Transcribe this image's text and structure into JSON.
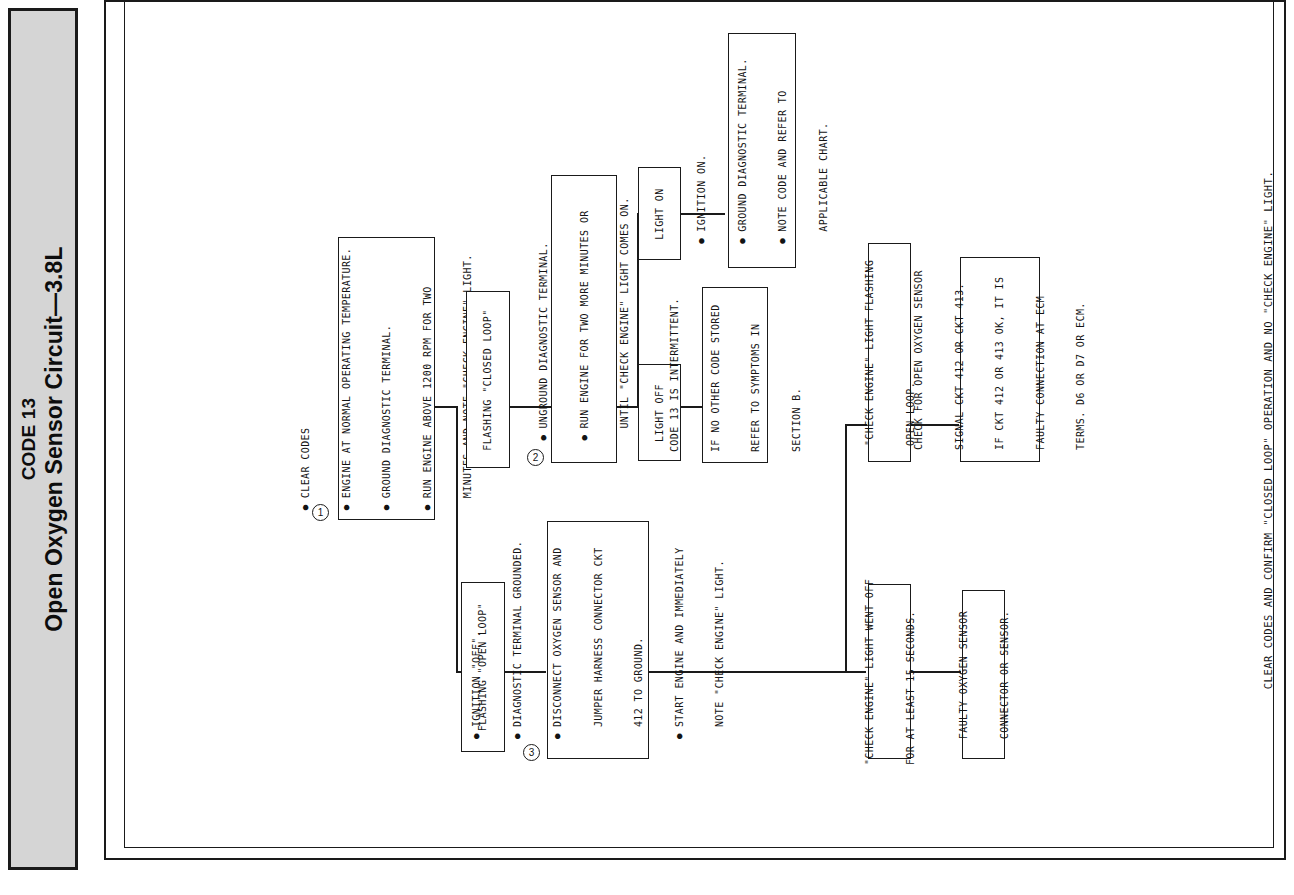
{
  "document": {
    "orientation": "rotated-90-ccw",
    "type": "diagnostic-flowchart"
  },
  "header": {
    "code_label": "CODE 13",
    "title": "Open Oxygen Sensor Circuit—3.8L",
    "band_color": "#d5d5d5",
    "border_color": "#1a1a1a"
  },
  "footer": {
    "note": "CLEAR CODES AND CONFIRM \"CLOSED LOOP\" OPERATION AND NO \"CHECK ENGINE\" LIGHT."
  },
  "steps": {
    "one": "1",
    "two": "2",
    "three": "3"
  },
  "boxes": {
    "step1": {
      "name": "clear-codes-step",
      "step": "1",
      "lines": [
        {
          "bullet": true,
          "text": "CLEAR CODES"
        },
        {
          "bullet": true,
          "text": "ENGINE AT NORMAL OPERATING TEMPERATURE."
        },
        {
          "bullet": true,
          "text": "GROUND DIAGNOSTIC TERMINAL."
        },
        {
          "bullet": true,
          "text": "RUN ENGINE ABOVE 1200 RPM FOR TWO"
        },
        {
          "bullet": false,
          "text": "MINUTES AND NOTE \"CHECK ENGINE\" LIGHT."
        }
      ]
    },
    "flashing_closed_loop": {
      "name": "flashing-closed-loop",
      "lines": [
        {
          "bullet": false,
          "text": "FLASHING \"CLOSED LOOP\""
        }
      ]
    },
    "step2": {
      "name": "unground-terminal-step",
      "step": "2",
      "lines": [
        {
          "bullet": true,
          "text": "UNGROUND DIAGNOSTIC TERMINAL."
        },
        {
          "bullet": true,
          "text": "RUN ENGINE FOR TWO MORE MINUTES OR"
        },
        {
          "bullet": false,
          "text": "UNTIL \"CHECK ENGINE\" LIGHT COMES ON."
        }
      ]
    },
    "light_on": {
      "name": "light-on-branch",
      "lines": [
        {
          "bullet": false,
          "text": "LIGHT ON"
        }
      ]
    },
    "light_off": {
      "name": "light-off-branch",
      "lines": [
        {
          "bullet": false,
          "text": "LIGHT OFF"
        }
      ]
    },
    "ignition_on": {
      "name": "ignition-on-step",
      "lines": [
        {
          "bullet": true,
          "text": "IGNITION ON."
        },
        {
          "bullet": true,
          "text": "GROUND DIAGNOSTIC TERMINAL."
        },
        {
          "bullet": true,
          "text": "NOTE CODE AND REFER TO"
        },
        {
          "bullet": false,
          "text": "APPLICABLE CHART."
        }
      ]
    },
    "intermittent": {
      "name": "code-13-intermittent",
      "lines": [
        {
          "bullet": false,
          "text": "CODE 13 IS INTERMITTENT."
        },
        {
          "bullet": false,
          "text": "IF NO OTHER CODE STORED"
        },
        {
          "bullet": false,
          "text": "REFER TO SYMPTOMS IN"
        },
        {
          "bullet": false,
          "text": "SECTION B."
        }
      ]
    },
    "flashing_open_loop_result": {
      "name": "check-engine-flashing-open-loop",
      "lines": [
        {
          "bullet": false,
          "text": "\"CHECK ENGINE\" LIGHT FLASHING"
        },
        {
          "bullet": false,
          "text": "OPEN LOOP."
        }
      ]
    },
    "check_open_sensor": {
      "name": "check-open-oxygen-sensor",
      "lines": [
        {
          "bullet": false,
          "text": "CHECK FOR OPEN OXYGEN SENSOR"
        },
        {
          "bullet": false,
          "text": "SIGNAL CKT 412 OR CKT 413."
        },
        {
          "bullet": false,
          "text": "IF CKT 412 OR 413 OK, IT IS"
        },
        {
          "bullet": false,
          "text": "FAULTY CONNECTION AT ECM"
        },
        {
          "bullet": false,
          "text": "TERMS. D6 OR D7 OR ECM."
        }
      ]
    },
    "flashing_open_loop": {
      "name": "flashing-open-loop",
      "lines": [
        {
          "bullet": false,
          "text": "FLASHING \"OPEN LOOP\""
        }
      ]
    },
    "step3": {
      "name": "jumper-harness-step",
      "step": "3",
      "lines": [
        {
          "bullet": true,
          "text": "IGNITION \"OFF\"."
        },
        {
          "bullet": true,
          "text": "DIAGNOSTIC TERMINAL GROUNDED."
        },
        {
          "bullet": true,
          "text": "DISCONNECT OXYGEN SENSOR AND"
        },
        {
          "bullet": false,
          "text": "JUMPER HARNESS CONNECTOR CKT"
        },
        {
          "bullet": false,
          "text": "412 TO GROUND."
        },
        {
          "bullet": true,
          "text": "START ENGINE AND IMMEDIATELY"
        },
        {
          "bullet": false,
          "text": "NOTE \"CHECK ENGINE\" LIGHT."
        }
      ]
    },
    "light_went_off": {
      "name": "check-engine-light-went-off",
      "lines": [
        {
          "bullet": false,
          "text": "\"CHECK ENGINE\" LIGHT WENT OFF"
        },
        {
          "bullet": false,
          "text": "FOR AT LEAST 15 SECONDS."
        }
      ]
    },
    "faulty_sensor": {
      "name": "faulty-oxygen-sensor",
      "lines": [
        {
          "bullet": false,
          "text": "FAULTY OXYGEN SENSOR"
        },
        {
          "bullet": false,
          "text": "CONNECTOR OR SENSOR."
        }
      ]
    }
  }
}
